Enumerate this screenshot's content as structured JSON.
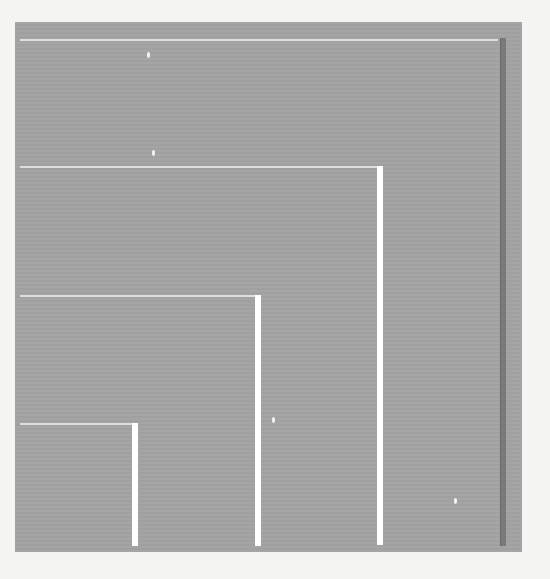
{
  "scene": {
    "description": "Gray panel with nested white L-shaped lines (concentric corners) and a dark vertical bar on the right",
    "colors": {
      "background": "#f4f4f2",
      "panel": "#a3a3a3",
      "lines": "#ffffff",
      "dark_bar": "#7a7a7a"
    },
    "corners": [
      {
        "h_y": 167,
        "v_x": 377
      },
      {
        "h_y": 296,
        "v_x": 255
      },
      {
        "h_y": 423,
        "v_x": 132
      }
    ]
  }
}
